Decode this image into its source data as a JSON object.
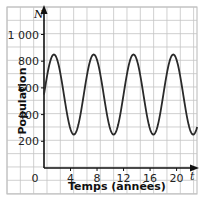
{
  "chart_data": {
    "type": "line",
    "title": "",
    "xlabel": "Temps (années)",
    "ylabel": "Population",
    "x_axis_name": "t",
    "y_axis_name": "N",
    "x_ticks": [
      "0",
      "4",
      "8",
      "12",
      "16",
      "20"
    ],
    "y_ticks": [
      "200",
      "400",
      "600",
      "800",
      "1 000"
    ],
    "xlim": [
      0,
      23
    ],
    "ylim": [
      0,
      1000
    ],
    "grid": true,
    "legend": null,
    "series": [
      {
        "name": "Population",
        "function": "N = 550 + 300 sin(2πt/6)",
        "x": [
          0,
          1.5,
          3,
          4.5,
          6,
          7.5,
          9,
          10.5,
          12,
          13.5,
          15,
          16.5,
          18,
          19.5,
          21,
          22.5,
          23
        ],
        "values": [
          550,
          850,
          550,
          250,
          550,
          850,
          550,
          250,
          550,
          850,
          550,
          250,
          550,
          850,
          550,
          250,
          300
        ]
      }
    ]
  }
}
